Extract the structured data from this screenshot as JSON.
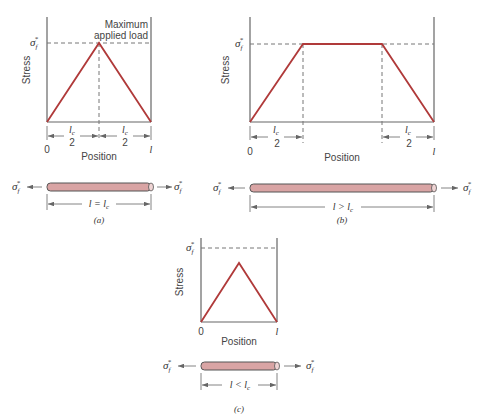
{
  "panels": {
    "a": {
      "caption": "(a)",
      "y_label": "Stress",
      "x_label": "Position",
      "sigma_label": "σ",
      "sigma_sub": "f",
      "sigma_sup": "*",
      "annotation_line1": "Maximum",
      "annotation_line2": "applied load",
      "tick_start": "0",
      "tick_end": "l",
      "half_len_num": "l",
      "half_len_num_sub": "c",
      "half_len_den": "2",
      "fiber_relation": "l = l",
      "fiber_relation_sub": "c",
      "profile": "triangle reaching σf* at midpoint"
    },
    "b": {
      "caption": "(b)",
      "y_label": "Stress",
      "x_label": "Position",
      "sigma_label": "σ",
      "sigma_sub": "f",
      "sigma_sup": "*",
      "tick_start": "0",
      "tick_end": "l",
      "half_len_num": "l",
      "half_len_num_sub": "c",
      "half_len_den": "2",
      "fiber_relation": "l > l",
      "fiber_relation_sub": "c",
      "profile": "trapezoid with plateau at σf*"
    },
    "c": {
      "caption": "(c)",
      "y_label": "Stress",
      "x_label": "Position",
      "sigma_label": "σ",
      "sigma_sub": "f",
      "sigma_sup": "*",
      "tick_start": "0",
      "tick_end": "l",
      "fiber_relation": "l < l",
      "fiber_relation_sub": "c",
      "profile": "triangle peaking below σf*"
    }
  },
  "colors": {
    "curve": "#b03a3a",
    "fiber_fill": "#d9a4a4",
    "axis": "#666666"
  }
}
